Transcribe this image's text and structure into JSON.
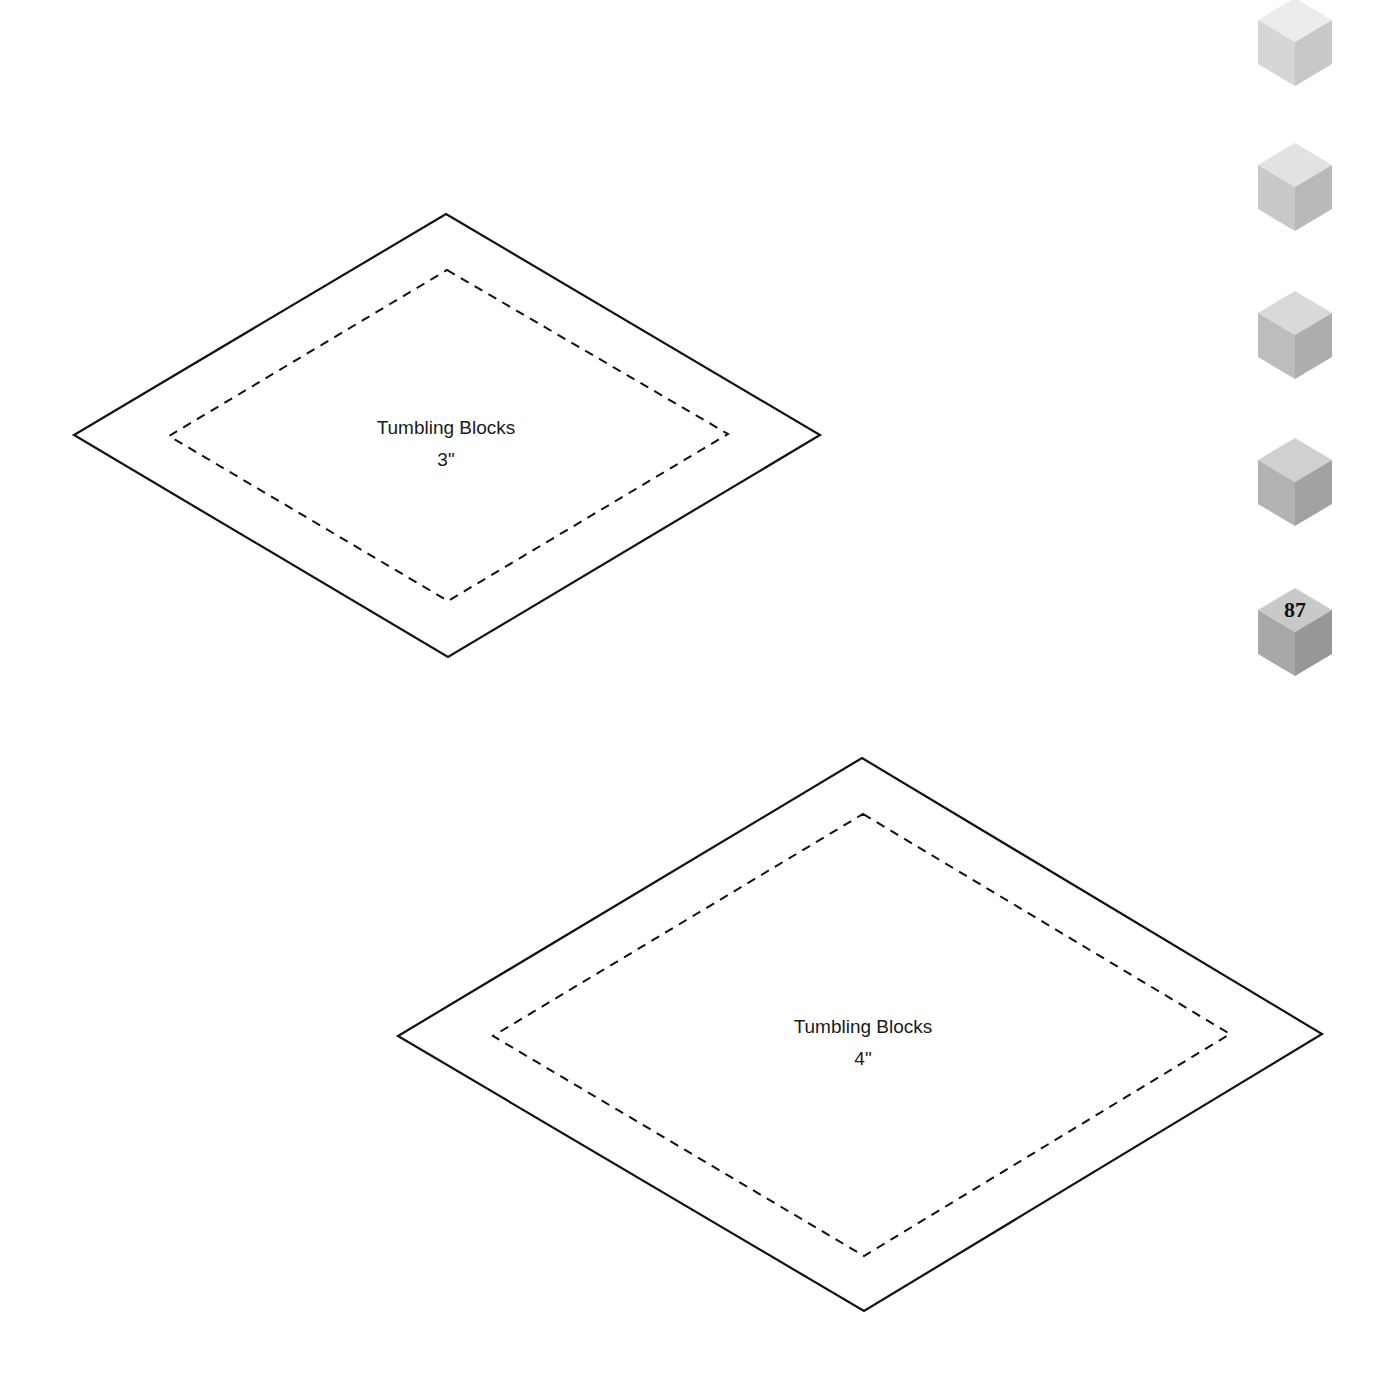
{
  "page": {
    "page_number": "87"
  },
  "templates": [
    {
      "name": "Tumbling Blocks",
      "size": "3\"",
      "outer": [
        [
          446,
          214
        ],
        [
          820,
          435
        ],
        [
          448,
          657
        ],
        [
          74,
          435
        ]
      ],
      "inner": [
        [
          447,
          270
        ],
        [
          728,
          434
        ],
        [
          448,
          601
        ],
        [
          169,
          436
        ]
      ],
      "label_x": 446,
      "label_y": 415
    },
    {
      "name": "Tumbling Blocks",
      "size": "4\"",
      "outer": [
        [
          862,
          758
        ],
        [
          1322,
          1034
        ],
        [
          864,
          1311
        ],
        [
          398,
          1036
        ]
      ],
      "inner": [
        [
          863,
          814
        ],
        [
          1230,
          1034
        ],
        [
          864,
          1256
        ],
        [
          493,
          1036
        ]
      ],
      "label_x": 863,
      "label_y": 1014
    }
  ],
  "side_cubes": [
    {
      "top_y": -2,
      "top_face": "#ececec",
      "left_face": "#d6d6d6",
      "right_face": "#c8c8c8"
    },
    {
      "top_y": 143,
      "top_face": "#e2e2e2",
      "left_face": "#c9c9c9",
      "right_face": "#b9b9b9"
    },
    {
      "top_y": 291,
      "top_face": "#d9d9d9",
      "left_face": "#bdbdbd",
      "right_face": "#adadad"
    },
    {
      "top_y": 438,
      "top_face": "#d0d0d0",
      "left_face": "#b2b2b2",
      "right_face": "#a2a2a2"
    },
    {
      "top_y": 588,
      "top_face": "#c9c9c9",
      "left_face": "#a8a8a8",
      "right_face": "#979797"
    }
  ],
  "colors": {
    "line": "#111111",
    "text": "#1a1a1a",
    "background": "#ffffff"
  }
}
